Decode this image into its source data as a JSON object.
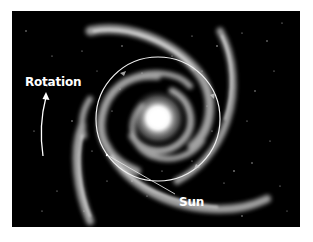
{
  "diagram": {
    "labels": {
      "rotation": "Rotation",
      "sun": "Sun"
    },
    "colors": {
      "background": "#000000",
      "page": "#ffffff",
      "annotation": "#ffffff",
      "arm": "#cfcfcf",
      "core": "#ffffff"
    },
    "orbit_circle": {
      "cx": 146,
      "cy": 108,
      "r": 62
    },
    "core": {
      "cx": 146,
      "cy": 107,
      "r": 26
    },
    "sun_marker": {
      "x": 95,
      "y": 144
    },
    "sun_leader": {
      "x1": 95,
      "y1": 144,
      "x2": 163,
      "y2": 183
    }
  }
}
